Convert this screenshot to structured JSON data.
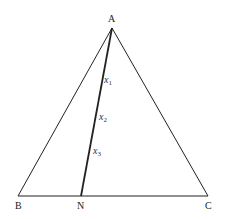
{
  "diagram": {
    "type": "triangle-with-cevian",
    "vertices": [
      {
        "name": "A",
        "x": 112,
        "y": 28,
        "label_x": 108,
        "label_y": 14
      },
      {
        "name": "B",
        "x": 18,
        "y": 196,
        "label_x": 15,
        "label_y": 201
      },
      {
        "name": "C",
        "x": 208,
        "y": 196,
        "label_x": 205,
        "label_y": 201
      },
      {
        "name": "N",
        "x": 81,
        "y": 196,
        "label_x": 77,
        "label_y": 201
      }
    ],
    "segments": [
      {
        "from": "A",
        "to": "B",
        "width": 1
      },
      {
        "from": "A",
        "to": "C",
        "width": 1
      },
      {
        "from": "B",
        "to": "C",
        "width": 1
      },
      {
        "from": "A",
        "to": "N",
        "width": 1.8
      }
    ],
    "points_on_AN": [
      {
        "var": "x",
        "sub": "1",
        "label_x": 104,
        "label_y": 75
      },
      {
        "var": "x",
        "sub": "2",
        "label_x": 99,
        "label_y": 112
      },
      {
        "var": "x",
        "sub": "3",
        "label_x": 93,
        "label_y": 146
      }
    ],
    "colors": {
      "line": "#222222",
      "label": "#222222"
    }
  }
}
